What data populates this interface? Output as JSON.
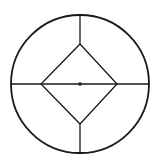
{
  "diagram": {
    "canvas": {
      "width": 154,
      "height": 158,
      "background": "#ffffff"
    },
    "stroke_color": "#1a1a1a",
    "outer_circle": {
      "cx": 80,
      "cy": 84,
      "r": 69,
      "stroke_width": 1.8
    },
    "diamond": {
      "points": [
        [
          80,
          44
        ],
        [
          117,
          84
        ],
        [
          80,
          124
        ],
        [
          41,
          84
        ]
      ],
      "stroke_width": 1.3
    },
    "lines": [
      {
        "name": "top-spoke",
        "x1": 80,
        "y1": 15,
        "x2": 80,
        "y2": 44
      },
      {
        "name": "bottom-spoke",
        "x1": 80,
        "y1": 124,
        "x2": 80,
        "y2": 153
      },
      {
        "name": "horizontal-diameter",
        "x1": 11,
        "y1": 84,
        "x2": 149,
        "y2": 84
      }
    ],
    "center_dot": {
      "cx": 80,
      "cy": 84,
      "r": 1.8
    }
  }
}
